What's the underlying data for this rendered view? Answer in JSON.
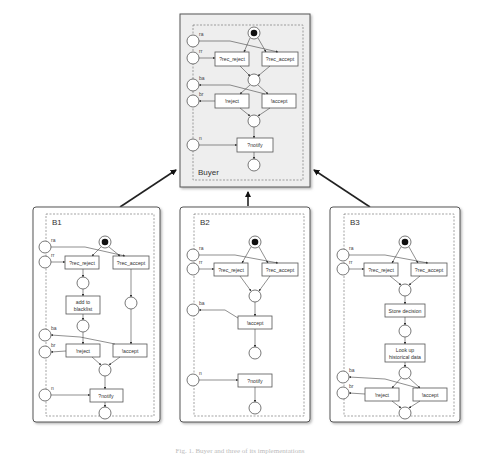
{
  "buyer": {
    "title": "Buyer",
    "ports": [
      "ra",
      "rr",
      "ba",
      "br",
      "n"
    ],
    "transitions": {
      "rec_reject": "?rec_reject",
      "rec_accept": "?rec_accept",
      "reject": "!reject",
      "accept": "!accept",
      "notify": "?notify"
    }
  },
  "b1": {
    "title": "B1",
    "ports": [
      "ra",
      "rr",
      "ba",
      "br",
      "n"
    ],
    "transitions": {
      "rec_reject": "?rec_reject",
      "rec_accept": "?rec_accept",
      "blacklist_1": "add to",
      "blacklist_2": "blacklist",
      "reject": "!reject",
      "accept": "!accept",
      "notify": "?notify"
    }
  },
  "b2": {
    "title": "B2",
    "ports": [
      "ra",
      "rr",
      "ba",
      "n"
    ],
    "transitions": {
      "rec_reject": "?rec_reject",
      "rec_accept": "?rec_accept",
      "accept": "!accept",
      "notify": "?notify"
    }
  },
  "b3": {
    "title": "B3",
    "ports": [
      "ra",
      "rr",
      "ba",
      "br"
    ],
    "transitions": {
      "rec_reject": "?rec_reject",
      "rec_accept": "?rec_accept",
      "store": "Store decision",
      "lookup_1": "Look up",
      "lookup_2": "historical data",
      "reject": "!reject",
      "accept": "!accept"
    }
  },
  "caption": "Fig. 1. Buyer and three of its implementations"
}
